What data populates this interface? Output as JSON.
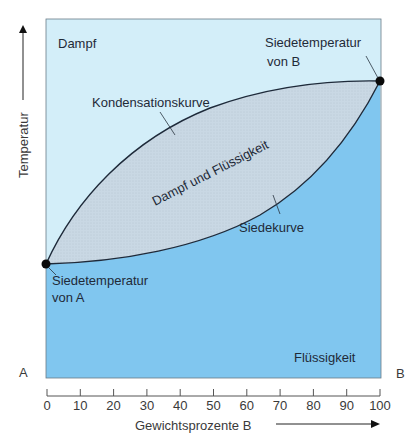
{
  "diagram": {
    "regions": {
      "vapor": "Dampf",
      "liquid": "Flüssigkeit",
      "two_phase": "Dampf und Flüssigkeit"
    },
    "curves": {
      "condensation": "Kondensationskurve",
      "boiling": "Siedekurve"
    },
    "points": {
      "a_line1": "Siedetemperatur",
      "a_line2": "von A",
      "b_line1": "Siedetemperatur",
      "b_line2": "von B"
    },
    "corner_labels": {
      "left": "A",
      "right": "B"
    },
    "y_axis_label": "Temperatur",
    "x_axis_label": "Gewichtsprozente  B",
    "x_ticks": [
      "0",
      "10",
      "20",
      "30",
      "40",
      "50",
      "60",
      "70",
      "80",
      "90",
      "100"
    ],
    "colors": {
      "vapor": "#d3eef9",
      "liquid": "#80c6ef",
      "two_phase": "#c9d8e4",
      "curve": "#1e2a3a",
      "point": "#0a0a0a"
    }
  },
  "chart_data": {
    "type": "line",
    "title": "",
    "xlabel": "Gewichtsprozente B",
    "ylabel": "Temperatur",
    "x_ticks": [
      0,
      10,
      20,
      30,
      40,
      50,
      60,
      70,
      80,
      90,
      100
    ],
    "xlim": [
      0,
      100
    ],
    "series": [
      {
        "name": "Kondensationskurve",
        "x": [
          0,
          10,
          20,
          30,
          40,
          50,
          60,
          70,
          80,
          90,
          100
        ],
        "y_relative": [
          0,
          0.3,
          0.48,
          0.61,
          0.71,
          0.79,
          0.86,
          0.91,
          0.95,
          0.98,
          1.0
        ]
      },
      {
        "name": "Siedekurve",
        "x": [
          0,
          10,
          20,
          30,
          40,
          50,
          60,
          70,
          80,
          90,
          100
        ],
        "y_relative": [
          0,
          0.02,
          0.06,
          0.12,
          0.19,
          0.28,
          0.38,
          0.5,
          0.64,
          0.8,
          1.0
        ]
      }
    ],
    "regions": [
      "Dampf",
      "Dampf und Flüssigkeit",
      "Flüssigkeit"
    ],
    "annotations": [
      "Siedetemperatur von A",
      "Siedetemperatur von B",
      "Kondensationskurve",
      "Siedekurve"
    ],
    "grid": false
  }
}
